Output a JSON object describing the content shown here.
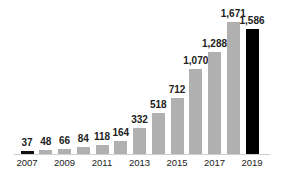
{
  "chart_data": {
    "type": "bar",
    "title": "",
    "xlabel": "",
    "ylabel": "",
    "categories": [
      "2007",
      "2008",
      "2009",
      "2010",
      "2011",
      "2012",
      "2013",
      "2014",
      "2015",
      "2016",
      "2017",
      "2018",
      "2019"
    ],
    "values": [
      37,
      48,
      66,
      84,
      118,
      164,
      332,
      518,
      712,
      1070,
      1288,
      1671,
      1586
    ],
    "value_labels": [
      "37",
      "48",
      "66",
      "84",
      "118",
      "164",
      "332",
      "518",
      "712",
      "1,070",
      "1,288",
      "1,671",
      "1,586"
    ],
    "tick_labels": [
      "2007",
      "2009",
      "2011",
      "2013",
      "2015",
      "2017",
      "2019"
    ],
    "bar_colors": [
      "#111111",
      "#b0b0b0",
      "#b0b0b0",
      "#b0b0b0",
      "#b0b0b0",
      "#b0b0b0",
      "#b0b0b0",
      "#b0b0b0",
      "#b0b0b0",
      "#b0b0b0",
      "#b0b0b0",
      "#b0b0b0",
      "#000000"
    ],
    "ylim": [
      0,
      1700
    ],
    "grid": false,
    "legend": null
  }
}
